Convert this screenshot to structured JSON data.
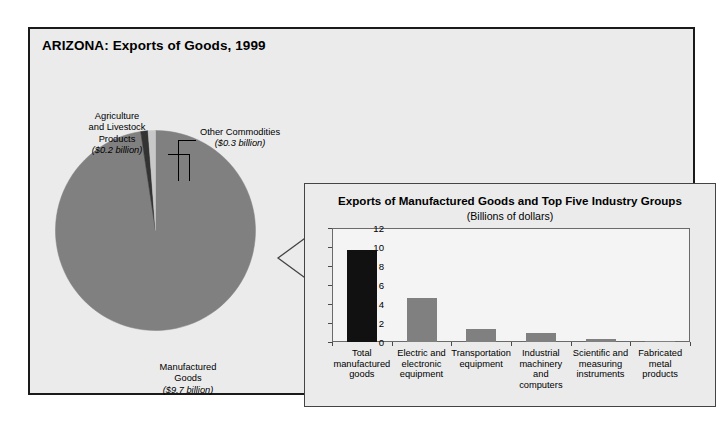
{
  "figure": {
    "title": "ARIZONA: Exports of Goods, 1999",
    "frame_border_color": "#1a1a1a",
    "background_color": "#ebebeb"
  },
  "pie": {
    "labels": {
      "agriculture": {
        "name": "Agriculture\nand Livestock\nProducts",
        "name_line1": "Agriculture",
        "name_line2": "and Livestock",
        "name_line3": "Products",
        "value_text": "($0.2 billion)"
      },
      "other": {
        "name_line1": "Other Commodities",
        "value_text": "($0.3 billion)"
      },
      "manufactured": {
        "name_line1": "Manufactured",
        "name_line2": "Goods",
        "value_text": "($9.7 billion)"
      }
    }
  },
  "panel": {
    "title": "Exports of Manufactured Goods and Top Five Industry Groups",
    "subtitle": "(Billions of dollars)"
  },
  "chart_data": {
    "type": "bar",
    "title": "Exports of Manufactured Goods and Top Five Industry Groups",
    "subtitle": "(Billions of dollars)",
    "xlabel": "",
    "ylabel": "",
    "ylim": [
      0,
      12
    ],
    "yticks": [
      0,
      2,
      4,
      6,
      8,
      10,
      12
    ],
    "ytick_labels": [
      "0",
      "2",
      "4",
      "6",
      "8",
      "10",
      "12"
    ],
    "grid": false,
    "legend": "none",
    "categories": [
      "Total manufactured goods",
      "Electric and electronic equipment",
      "Transportation equipment",
      "Industrial machinery and computers",
      "Scientific and measuring instruments",
      "Fabricated metal products"
    ],
    "category_lines": [
      [
        "Total",
        "manufactured",
        "goods"
      ],
      [
        "Electric and",
        "electronic",
        "equipment"
      ],
      [
        "Transportation",
        "equipment"
      ],
      [
        "Industrial",
        "machinery",
        "and",
        "computers"
      ],
      [
        "Scientific and",
        "measuring",
        "instruments"
      ],
      [
        "Fabricated",
        "metal",
        "products"
      ]
    ],
    "values": [
      9.7,
      4.6,
      1.35,
      0.9,
      0.35,
      0.1
    ],
    "bar_colors": [
      "#111111",
      "#808080",
      "#808080",
      "#808080",
      "#808080",
      "#808080"
    ]
  },
  "pie_data": {
    "type": "pie",
    "title": "ARIZONA: Exports of Goods, 1999",
    "unit": "billions of dollars",
    "labels": [
      "Manufactured Goods",
      "Agriculture and Livestock Products",
      "Other Commodities"
    ],
    "values": [
      9.7,
      0.2,
      0.3
    ],
    "value_texts": [
      "($9.7 billion)",
      "($0.2 billion)",
      "($0.3 billion)"
    ],
    "colors": [
      "#808080",
      "#333333",
      "#c8c8c8"
    ]
  },
  "colors": {
    "bar_primary": "#111111",
    "bar_secondary": "#808080",
    "pie_main": "#808080",
    "pie_agriculture": "#333333",
    "pie_other": "#c8c8c8",
    "frame": "#1a1a1a",
    "panel_border": "#444444",
    "background": "#ebebeb"
  }
}
